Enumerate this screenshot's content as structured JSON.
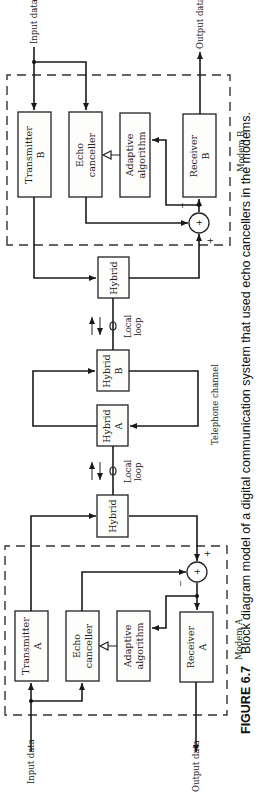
{
  "figure": {
    "number_label": "FIGURE 6.7",
    "caption": "Block diagram model of a digital communication system that used  echo cancellers in the modems."
  },
  "modem_a": {
    "label": "Modem A",
    "transmitter": [
      "Transmitter",
      "A"
    ],
    "echo_canceller": [
      "Echo",
      "canceller"
    ],
    "adaptive_algorithm": [
      "Adaptive",
      "algorithm"
    ],
    "receiver": [
      "Receiver",
      "A"
    ],
    "input_label": "Input data",
    "output_label": "Output data",
    "summer_symbol": "+",
    "summer_minus": "−",
    "summer_plus": "+"
  },
  "modem_b": {
    "label": "Modem B",
    "transmitter": [
      "Transmitter",
      "B"
    ],
    "echo_canceller": [
      "Echo",
      "canceller"
    ],
    "adaptive_algorithm": [
      "Adaptive",
      "algorithm"
    ],
    "receiver": [
      "Receiver",
      "B"
    ],
    "input_label": "Input data",
    "output_label": "Output data",
    "summer_symbol": "+",
    "summer_minus": "−",
    "summer_plus": "+"
  },
  "network": {
    "hybrid_a_side": "Hybrid",
    "hybrid_b_side": "Hybrid",
    "hybrid_a": [
      "Hybrid",
      "A"
    ],
    "hybrid_b": [
      "Hybrid",
      "B"
    ],
    "local_loop_a": [
      "Local",
      "loop"
    ],
    "local_loop_b": [
      "Local",
      "loop"
    ],
    "telephone_channel": "Telephone channel"
  }
}
